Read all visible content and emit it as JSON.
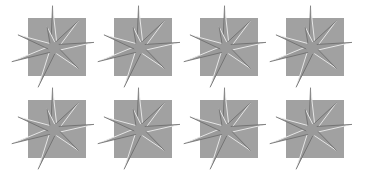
{
  "canvas": {
    "width": 365,
    "height": 171,
    "background": "#ffffff"
  },
  "colors": {
    "square": "#a1a1a1",
    "star_fill": "#9a9a9a",
    "highlight": "#e6e6e6",
    "shadow": "#6a6a6a"
  },
  "grid": {
    "columns": [
      28,
      114,
      200,
      286
    ],
    "rows": [
      18,
      100
    ],
    "square_size": 58
  },
  "star": {
    "points": 8,
    "rays": [
      {
        "angle": -92,
        "length": 42
      },
      {
        "angle": -48,
        "length": 36
      },
      {
        "angle": -8,
        "length": 40
      },
      {
        "angle": 40,
        "length": 32
      },
      {
        "angle": 112,
        "length": 42
      },
      {
        "angle": 162,
        "length": 44
      },
      {
        "angle": 200,
        "length": 38
      },
      {
        "angle": 252,
        "length": 22
      }
    ],
    "inner_radius": 6,
    "center_offset": [
      26,
      30
    ]
  },
  "tiles": [
    {
      "id": "tile-1",
      "row": 0,
      "col": 0
    },
    {
      "id": "tile-2",
      "row": 0,
      "col": 1
    },
    {
      "id": "tile-3",
      "row": 0,
      "col": 2
    },
    {
      "id": "tile-4",
      "row": 0,
      "col": 3
    },
    {
      "id": "tile-5",
      "row": 1,
      "col": 0
    },
    {
      "id": "tile-6",
      "row": 1,
      "col": 1
    },
    {
      "id": "tile-7",
      "row": 1,
      "col": 2
    },
    {
      "id": "tile-8",
      "row": 1,
      "col": 3
    }
  ]
}
